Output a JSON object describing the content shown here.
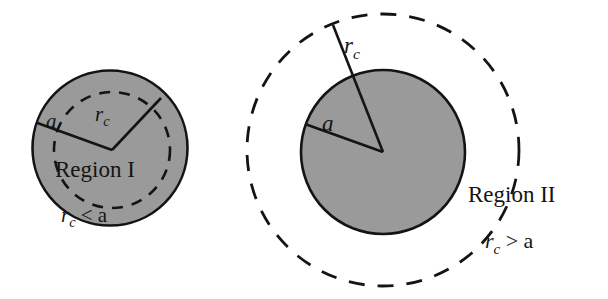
{
  "figure": {
    "background_color": "#ffffff",
    "stroke_color": "#141414",
    "fill_gray": "#9a9a9a",
    "panels": [
      {
        "id": "panel-left",
        "region_label": "Region I",
        "condition_label": "r",
        "condition_sub": "c",
        "condition_rest": " < a",
        "radius_outer_label": "a",
        "radius_inner_label": "r",
        "radius_inner_sub": "c",
        "shaded_circle": {
          "cx": 110,
          "cy": 148,
          "r": 78,
          "style": "solid-outline-gray-fill"
        },
        "dashed_circle": {
          "cx": 112,
          "cy": 150,
          "r": 58,
          "style": "dashed-outline-no-fill"
        },
        "radius_line_a": {
          "x1": 112,
          "y1": 150,
          "x2": 37,
          "y2": 123
        },
        "radius_line_rc": {
          "x1": 112,
          "y1": 150,
          "x2": 160,
          "y2": 99
        }
      },
      {
        "id": "panel-right",
        "region_label": "Region II",
        "condition_label": "r",
        "condition_sub": "c",
        "condition_rest": " > a",
        "radius_outer_label": "r",
        "radius_outer_sub": "c",
        "radius_inner_label": "a",
        "shaded_circle": {
          "cx": 383,
          "cy": 152,
          "r": 82,
          "style": "solid-outline-gray-fill"
        },
        "dashed_circle": {
          "cx": 383,
          "cy": 150,
          "r": 136,
          "style": "dashed-outline-no-fill"
        },
        "radius_line_rc": {
          "x1": 383,
          "y1": 152,
          "x2": 334,
          "y2": 26
        },
        "radius_line_a": {
          "x1": 383,
          "y1": 152,
          "x2": 307,
          "y2": 124
        }
      }
    ]
  }
}
